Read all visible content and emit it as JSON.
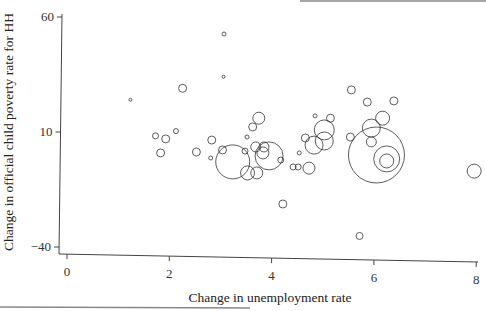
{
  "chart_data": {
    "type": "scatter",
    "title": "",
    "xlabel": "Change in unemployment rate",
    "ylabel": "Change in official child poverty rate for HH",
    "xlim": [
      0,
      8
    ],
    "ylim": [
      -40,
      60
    ],
    "x_ticks": [
      0,
      2,
      4,
      6,
      8
    ],
    "y_ticks": [
      60,
      10,
      -40
    ],
    "x_tick_labels": [
      "0",
      "2",
      "4",
      "6",
      "8"
    ],
    "y_tick_labels": [
      "60",
      "10",
      "−40"
    ],
    "grid": false,
    "legend": null,
    "marker": "hollow circle, size proportional to weight",
    "points": [
      {
        "x": 1.24,
        "y": 24.0,
        "r": 1.5
      },
      {
        "x": 3.07,
        "y": 52.6,
        "r": 2
      },
      {
        "x": 3.06,
        "y": 34.0,
        "r": 1.5
      },
      {
        "x": 2.26,
        "y": 29.0,
        "r": 4
      },
      {
        "x": 1.73,
        "y": 8.3,
        "r": 3
      },
      {
        "x": 1.93,
        "y": 7.0,
        "r": 4
      },
      {
        "x": 2.13,
        "y": 10.4,
        "r": 2.5
      },
      {
        "x": 1.83,
        "y": 0.9,
        "r": 4
      },
      {
        "x": 2.53,
        "y": 1.3,
        "r": 4
      },
      {
        "x": 2.83,
        "y": 6.5,
        "r": 4
      },
      {
        "x": 2.81,
        "y": -1.3,
        "r": 2
      },
      {
        "x": 3.24,
        "y": -3.0,
        "r": 17
      },
      {
        "x": 3.04,
        "y": 2.2,
        "r": 4
      },
      {
        "x": 3.52,
        "y": 7.8,
        "r": 2
      },
      {
        "x": 3.75,
        "y": 16.0,
        "r": 6
      },
      {
        "x": 3.63,
        "y": 12.2,
        "r": 4
      },
      {
        "x": 3.48,
        "y": 1.7,
        "r": 3
      },
      {
        "x": 3.69,
        "y": 3.5,
        "r": 5
      },
      {
        "x": 3.83,
        "y": 0.9,
        "r": 6
      },
      {
        "x": 3.95,
        "y": -0.4,
        "r": 14
      },
      {
        "x": 3.53,
        "y": -7.8,
        "r": 7
      },
      {
        "x": 3.71,
        "y": -7.8,
        "r": 6
      },
      {
        "x": 3.85,
        "y": 3.5,
        "r": 5
      },
      {
        "x": 4.18,
        "y": -2.2,
        "r": 3
      },
      {
        "x": 4.22,
        "y": -21.3,
        "r": 4
      },
      {
        "x": 4.42,
        "y": -5.2,
        "r": 3
      },
      {
        "x": 4.52,
        "y": -5.2,
        "r": 3
      },
      {
        "x": 4.73,
        "y": -5.7,
        "r": 6
      },
      {
        "x": 4.54,
        "y": 0.9,
        "r": 2
      },
      {
        "x": 4.66,
        "y": 7.4,
        "r": 4
      },
      {
        "x": 4.85,
        "y": 17.0,
        "r": 2
      },
      {
        "x": 5.03,
        "y": 10.9,
        "r": 10
      },
      {
        "x": 5.15,
        "y": 16.0,
        "r": 4
      },
      {
        "x": 4.83,
        "y": 4.3,
        "r": 9
      },
      {
        "x": 5.03,
        "y": 6.1,
        "r": 9
      },
      {
        "x": 5.56,
        "y": 28.3,
        "r": 4
      },
      {
        "x": 5.87,
        "y": 23.0,
        "r": 4
      },
      {
        "x": 6.39,
        "y": 23.5,
        "r": 4
      },
      {
        "x": 5.54,
        "y": 7.8,
        "r": 4
      },
      {
        "x": 5.95,
        "y": 11.7,
        "r": 9
      },
      {
        "x": 6.17,
        "y": 16.0,
        "r": 7
      },
      {
        "x": 5.95,
        "y": 5.7,
        "r": 5
      },
      {
        "x": 6.05,
        "y": 0.0,
        "r": 28
      },
      {
        "x": 6.25,
        "y": -1.7,
        "r": 13
      },
      {
        "x": 6.25,
        "y": -2.6,
        "r": 7
      },
      {
        "x": 7.96,
        "y": -7.0,
        "r": 7
      },
      {
        "x": 5.72,
        "y": -35.2,
        "r": 3.5
      }
    ]
  }
}
